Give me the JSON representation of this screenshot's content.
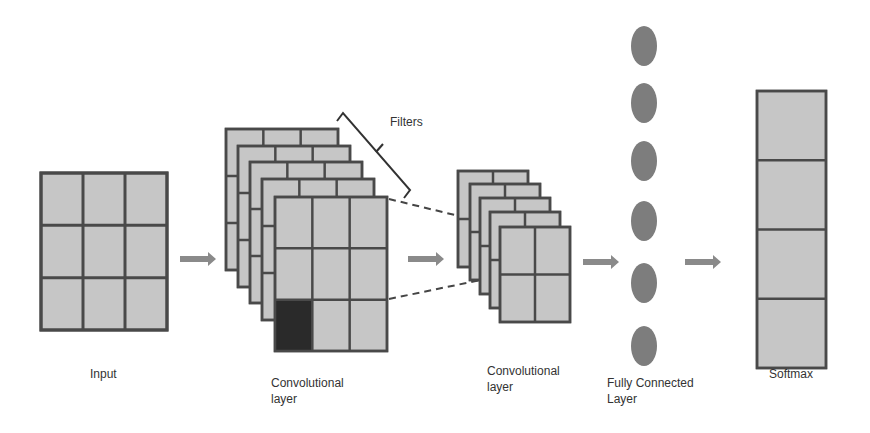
{
  "diagram": {
    "colors": {
      "cell_fill": "#c6c6c6",
      "grid_line": "#4a4a4a",
      "highlight_cell": "#2a2a2a",
      "node_fill": "#7d7d7d",
      "arrow": "#8a8a8a",
      "dashed_line": "#444444",
      "text": "#333333",
      "background": "#ffffff"
    },
    "stages": [
      {
        "id": "input",
        "label": "Input",
        "grid": "3x3",
        "count": 1
      },
      {
        "id": "conv1",
        "label": "Convolutional\nlayer",
        "grid": "3x3",
        "count": 5,
        "highlighted_cell": "bottom-left"
      },
      {
        "id": "conv2",
        "label": "Convolutional\nlayer",
        "grid": "2x2",
        "count": 5
      },
      {
        "id": "fc",
        "label": "Fully Connected\nLayer",
        "nodes": 6
      },
      {
        "id": "softmax",
        "label": "Softmax",
        "cells": 4
      }
    ],
    "annotations": [
      {
        "id": "filters",
        "label": "Filters",
        "type": "bracket",
        "target": "conv1 stack"
      }
    ],
    "arrows": 4,
    "dashed_projection": {
      "from": "conv1 front map",
      "to": "conv2 front map"
    }
  }
}
